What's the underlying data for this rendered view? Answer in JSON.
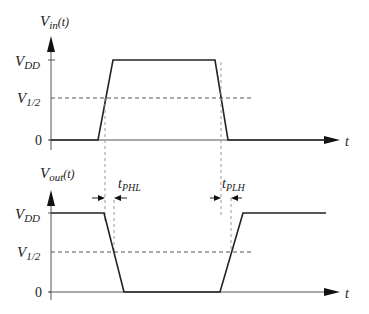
{
  "figure": {
    "type": "CMOS inverter propagation delay timing diagram",
    "colors": {
      "waveform": "#222222",
      "axis": "#555555",
      "dashed": "#555555",
      "guide": "#999999"
    }
  },
  "top_plot": {
    "y_axis_label_main": "V",
    "y_axis_label_sub": "in",
    "y_axis_label_suffix": "(t)",
    "x_axis_label": "t",
    "levels": [
      {
        "main": "V",
        "sub": "DD"
      },
      {
        "main": "V",
        "sub": "1/2"
      },
      {
        "main": "0",
        "sub": ""
      }
    ]
  },
  "bottom_plot": {
    "y_axis_label_main": "V",
    "y_axis_label_sub": "out",
    "y_axis_label_suffix": "(t)",
    "x_axis_label": "t",
    "levels": [
      {
        "main": "V",
        "sub": "DD"
      },
      {
        "main": "V",
        "sub": "1/2"
      },
      {
        "main": "0",
        "sub": ""
      }
    ]
  },
  "annotations": {
    "t_phl": {
      "main": "t",
      "sub": "PHL"
    },
    "t_plh": {
      "main": "t",
      "sub": "PLH"
    }
  }
}
